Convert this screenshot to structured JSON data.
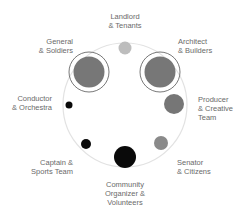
{
  "diagram": {
    "outer_circle": {
      "cx": 125,
      "cy": 105,
      "r": 62,
      "stroke": "#e2e2e2"
    },
    "nodes": [
      {
        "id": "landlord",
        "lines": [
          "Landlord",
          "& Tenants"
        ],
        "cx": 125,
        "cy": 48,
        "r": 6.5,
        "fill": "#bdbdbd",
        "ring": false
      },
      {
        "id": "architect",
        "lines": [
          "Architect",
          "& Builders"
        ],
        "cx": 160,
        "cy": 72,
        "r": 15.5,
        "fill": "#777777",
        "ring": true
      },
      {
        "id": "producer",
        "lines": [
          "Producer",
          "& Creative",
          "Team"
        ],
        "cx": 174,
        "cy": 104,
        "r": 10,
        "fill": "#767676",
        "ring": false
      },
      {
        "id": "senator",
        "lines": [
          "Senator",
          "& Citizens"
        ],
        "cx": 161,
        "cy": 143,
        "r": 7,
        "fill": "#8a8a8a",
        "ring": false
      },
      {
        "id": "community",
        "lines": [
          "Community",
          "Organizer &",
          "Volunteers"
        ],
        "cx": 125,
        "cy": 157,
        "r": 11,
        "fill": "#0a0a0a",
        "ring": false
      },
      {
        "id": "captain",
        "lines": [
          "Captain &",
          "Sports Team"
        ],
        "cx": 86,
        "cy": 144,
        "r": 5,
        "fill": "#0a0a0a",
        "ring": false
      },
      {
        "id": "conductor",
        "lines": [
          "Conductor",
          "& Orchestra"
        ],
        "cx": 69,
        "cy": 105,
        "r": 3.5,
        "fill": "#0a0a0a",
        "ring": false
      },
      {
        "id": "general",
        "lines": [
          "General",
          "& Soldiers"
        ],
        "cx": 89,
        "cy": 72,
        "r": 15.5,
        "fill": "#777777",
        "ring": true
      }
    ],
    "ring_color": "#555555"
  }
}
